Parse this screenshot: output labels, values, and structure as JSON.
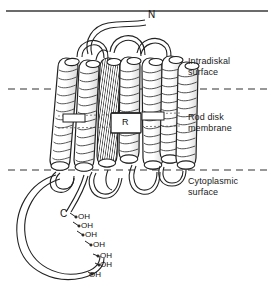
{
  "figure": {
    "title_rule": true,
    "background_color": "#ffffff",
    "ink_color": "#1a1a1a"
  },
  "terminals": [
    {
      "id": "n-terminus",
      "label": "N",
      "x": 148,
      "y": 14
    },
    {
      "id": "c-terminus",
      "label": "C",
      "x": 60,
      "y": 214
    }
  ],
  "chromophore": {
    "label": "R",
    "box": {
      "x": 111,
      "y": 113,
      "width": 30,
      "height": 20
    }
  },
  "region_labels": [
    {
      "id": "intradiskal-surface",
      "text": "Intradiskal\nsurface",
      "x": 188,
      "y": 56
    },
    {
      "id": "rod-disk-membrane",
      "text": "Rod disk\nmembrane",
      "x": 188,
      "y": 112
    },
    {
      "id": "cytoplasmic-surface",
      "text": "Cytoplasmic\nsurface",
      "x": 188,
      "y": 176
    }
  ],
  "membrane_boundaries": [
    {
      "id": "intradiskal-boundary",
      "y": 89,
      "x1": 8,
      "x2": 268,
      "style": "dashed"
    },
    {
      "id": "cytoplasmic-boundary",
      "y": 170,
      "x1": 8,
      "x2": 268,
      "style": "dashed"
    }
  ],
  "helices": [
    {
      "id": "helix-1",
      "order": 1
    },
    {
      "id": "helix-2",
      "order": 2
    },
    {
      "id": "helix-3",
      "order": 3
    },
    {
      "id": "helix-4",
      "order": 4
    },
    {
      "id": "helix-5",
      "order": 5
    },
    {
      "id": "helix-6",
      "order": 6
    },
    {
      "id": "helix-7",
      "order": 7
    }
  ],
  "hydroxyl_groups": [
    {
      "label": "OH",
      "x": 78,
      "y": 216
    },
    {
      "label": "OH",
      "x": 81,
      "y": 225
    },
    {
      "label": "OH",
      "x": 85,
      "y": 234
    },
    {
      "label": "OH",
      "x": 92,
      "y": 244
    },
    {
      "label": "OH",
      "x": 99,
      "y": 257
    },
    {
      "label": "OH",
      "x": 99,
      "y": 266
    },
    {
      "label": "OH",
      "x": 88,
      "y": 275
    }
  ]
}
